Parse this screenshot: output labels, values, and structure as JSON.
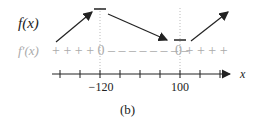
{
  "diagram": {
    "row_labels": {
      "function": "f(x)",
      "derivative": "f′(x)"
    },
    "sign_segments": [
      {
        "text": "+ + + + 0",
        "x": 52
      },
      {
        "text": "– – – – – – – –",
        "x": 108
      },
      {
        "text": "0 + + + +",
        "x": 175
      }
    ],
    "critical_points": [
      {
        "label": "−120",
        "x": 100,
        "type": "local max"
      },
      {
        "label": "100",
        "x": 180,
        "type": "local min"
      }
    ],
    "axis_label": "x",
    "caption": "(b)",
    "colors": {
      "ink": "#222222",
      "muted": "#aaaaaa"
    }
  }
}
